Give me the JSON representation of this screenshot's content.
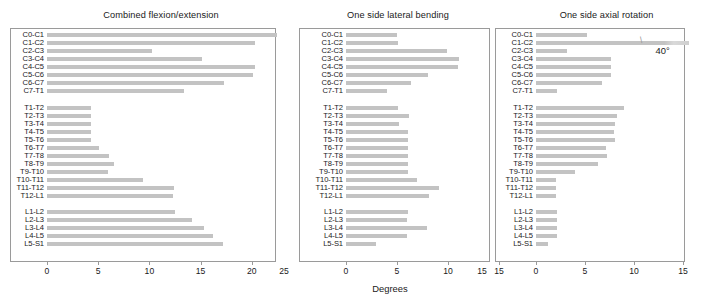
{
  "figure": {
    "xlabel": "Degrees",
    "bar_color": "#c3c3c3",
    "axis_color": "#9a9a9a",
    "text_color": "#1a1a1a"
  },
  "levels": [
    "C0-C1",
    "C1-C2",
    "C2-C3",
    "C3-C4",
    "C4-C5",
    "C5-C6",
    "C6-C7",
    "C7-T1",
    "T1-T2",
    "T2-T3",
    "T3-T4",
    "T4-T5",
    "T5-T6",
    "T6-T7",
    "T7-T8",
    "T8-T9",
    "T9-T10",
    "T10-T11",
    "T11-T12",
    "T12-L1",
    "L1-L2",
    "L2-L3",
    "L3-L4",
    "L4-L5",
    "L5-S1"
  ],
  "chart_data": [
    {
      "type": "bar",
      "orientation": "horizontal",
      "title": "Combined flexion/extension",
      "xlabel": "Degrees",
      "ylabel": "",
      "xlim": [
        0,
        23
      ],
      "ticks": [
        0,
        5,
        10,
        15,
        20
      ],
      "tick_labels": [
        "0",
        "5",
        "10",
        "15",
        "20"
      ],
      "grid": false,
      "legend": null,
      "categories": [
        "C0-C1",
        "C1-C2",
        "C2-C3",
        "C3-C4",
        "C4-C5",
        "C5-C6",
        "C6-C7",
        "C7-T1",
        "T1-T2",
        "T2-T3",
        "T3-T4",
        "T4-T5",
        "T5-T6",
        "T6-T7",
        "T7-T8",
        "T8-T9",
        "T9-T10",
        "T10-T11",
        "T11-T12",
        "T12-L1",
        "L1-L2",
        "L2-L3",
        "L3-L4",
        "L4-L5",
        "L5-S1"
      ],
      "values": [
        22.5,
        20.3,
        10.3,
        15.1,
        20.3,
        20.1,
        17.3,
        13.4,
        4.3,
        4.3,
        4.3,
        4.3,
        4.3,
        5.1,
        6.1,
        6.5,
        6.0,
        9.4,
        12.4,
        12.3,
        12.5,
        14.2,
        15.3,
        16.2,
        17.2
      ]
    },
    {
      "type": "bar",
      "orientation": "horizontal",
      "title": "One side lateral bending",
      "xlabel": "Degrees",
      "ylabel": "",
      "xlim": [
        0,
        15
      ],
      "ticks": [
        0,
        5,
        10,
        15
      ],
      "tick_labels": [
        "0",
        "5",
        "10",
        "15"
      ],
      "left_edge_label": "25",
      "grid": false,
      "legend": null,
      "categories": [
        "C0-C1",
        "C1-C2",
        "C2-C3",
        "C3-C4",
        "C4-C5",
        "C5-C6",
        "C6-C7",
        "C7-T1",
        "T1-T2",
        "T2-T3",
        "T3-T4",
        "T4-T5",
        "T5-T6",
        "T6-T7",
        "T7-T8",
        "T8-T9",
        "T9-T10",
        "T10-T11",
        "T11-T12",
        "T12-L1",
        "L1-L2",
        "L2-L3",
        "L3-L4",
        "L4-L5",
        "L5-S1"
      ],
      "values": [
        5.0,
        5.1,
        9.9,
        11.1,
        11.0,
        8.0,
        6.4,
        4.0,
        5.1,
        6.2,
        5.2,
        6.1,
        6.1,
        6.1,
        6.1,
        6.1,
        6.1,
        7.0,
        9.1,
        8.1,
        6.1,
        6.0,
        7.9,
        6.0,
        2.9
      ]
    },
    {
      "type": "bar",
      "orientation": "horizontal",
      "title": "One side axial rotation",
      "xlabel": "Degrees",
      "ylabel": "",
      "xlim": [
        0,
        15
      ],
      "ticks": [
        0,
        5,
        10,
        15
      ],
      "tick_labels": [
        "0",
        "5",
        "10",
        "15"
      ],
      "left_edge_label": "15",
      "grid": false,
      "legend": null,
      "annotation": "40°",
      "annotation_level": "C1-C2",
      "categories": [
        "C0-C1",
        "C1-C2",
        "C2-C3",
        "C3-C4",
        "C4-C5",
        "C5-C6",
        "C6-C7",
        "C7-T1",
        "T1-T2",
        "T2-T3",
        "T3-T4",
        "T4-T5",
        "T5-T6",
        "T6-T7",
        "T7-T8",
        "T8-T9",
        "T9-T10",
        "T10-T11",
        "T11-T12",
        "T12-L1",
        "L1-L2",
        "L2-L3",
        "L3-L4",
        "L4-L5",
        "L5-S1"
      ],
      "values": [
        5.2,
        40.0,
        3.2,
        7.7,
        7.7,
        7.7,
        6.7,
        2.1,
        9.0,
        8.3,
        8.1,
        8.0,
        8.1,
        7.1,
        7.2,
        6.3,
        4.0,
        2.0,
        2.0,
        2.0,
        2.1,
        2.1,
        2.1,
        2.1,
        1.2
      ],
      "broken_bars": [
        "C1-C2"
      ]
    }
  ]
}
